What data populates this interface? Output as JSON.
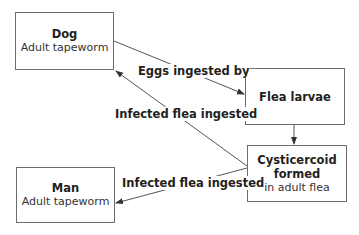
{
  "nodes": {
    "dog": {
      "title": "Dog",
      "subtitle": "Adult tapeworm"
    },
    "flea_larvae": {
      "title": "Flea larvae"
    },
    "cysticercoid": {
      "title": "Cysticercoid formed",
      "title_line1": "Cysticercoid",
      "title_line2": "formed",
      "subtitle": "in adult flea"
    },
    "man": {
      "title": "Man",
      "subtitle": "Adult tapeworm"
    }
  },
  "edges": [
    {
      "from": "dog",
      "to": "flea_larvae",
      "label": "Eggs ingested by"
    },
    {
      "from": "flea_larvae",
      "to": "cysticercoid",
      "label": ""
    },
    {
      "from": "cysticercoid",
      "to": "dog",
      "label": "Infected flea ingested"
    },
    {
      "from": "cysticercoid",
      "to": "man",
      "label": "Infected flea ingested"
    }
  ],
  "colors": {
    "line": "#555555",
    "border": "#6d6e71",
    "text": "#231f20"
  }
}
